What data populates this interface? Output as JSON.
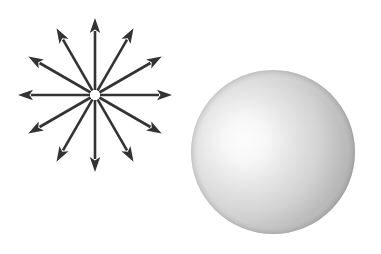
{
  "figure": {
    "background_color": "#ffffff",
    "width": 381,
    "height": 254,
    "caption": ""
  },
  "arrow_burst": {
    "label": "radial-arrow-burst",
    "center_x": 95,
    "center_y": 95,
    "inner_gap_radius": 5,
    "arrow_length": 77,
    "arrow_count": 12,
    "angle_step_degrees": 30,
    "stroke_color": "#333333",
    "stroke_width": 2.6,
    "head_length": 15,
    "head_half_width": 5.2,
    "center_fill": "#ffffff",
    "angles_degrees": [
      0,
      30,
      60,
      90,
      120,
      150,
      180,
      210,
      240,
      270,
      300,
      330
    ]
  },
  "sphere": {
    "label": "shaded-sphere",
    "center_x": 273,
    "center_y": 152,
    "radius": 82,
    "highlight_x": 245,
    "highlight_y": 140,
    "highlight_radius": 20,
    "highlight_color": "#fdfdfd",
    "mid_color": "#d2d2d2",
    "shadow_color": "#9a9a9a",
    "terminator_color": "#808080",
    "rim_color": "#8c8c8c"
  }
}
